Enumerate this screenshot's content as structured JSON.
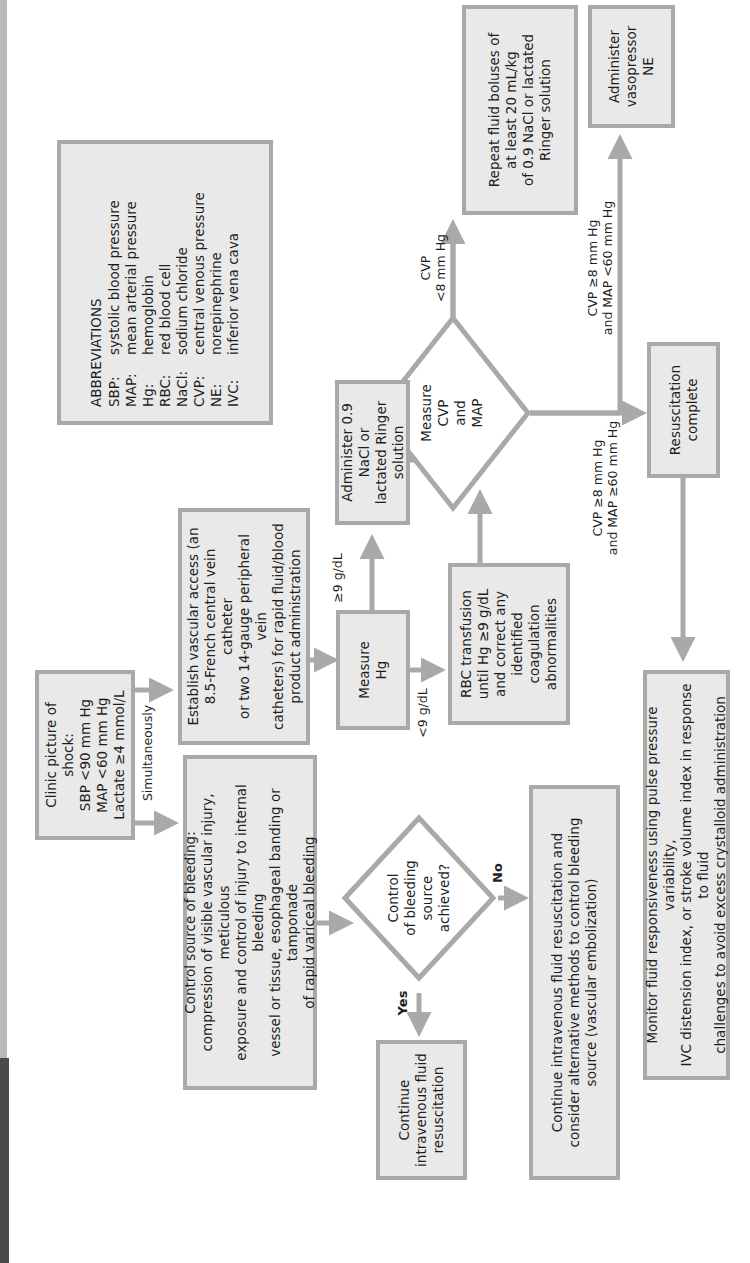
{
  "page": {
    "orientation": "rotated-90-ccw"
  },
  "flowchart": {
    "start": {
      "title": "Clinic picture of shock:",
      "lines": [
        "SBP <90 mm Hg",
        "MAP <60 mm Hg",
        "Lactate ≥4 mmol/L"
      ]
    },
    "branch_label": "Simultaneously",
    "control_bleeding": {
      "title": "Control source of bleeding:",
      "body": "compression of visible vascular injury, meticulous\nexposure and control of injury to internal bleeding\nvessel or tissue, esophageal banding or tamponade\nof rapid variceal bleeding"
    },
    "vascular_access": {
      "text": "Establish vascular access (an\n8.5-French central vein catheter\nor two 14-gauge peripheral vein\ncatheters) for rapid fluid/blood\nproduct administration"
    },
    "bleeding_decision": {
      "text": "Control\nof bleeding\nsource\nachieved?",
      "yes_label": "Yes",
      "no_label": "No"
    },
    "continue_iv": {
      "text": "Continue\nintravenous fluid\nresuscitation"
    },
    "continue_iv_alt": {
      "text": "Continue intravenous fluid resuscitation and\nconsider alternative methods to control bleeding\nsource (vascular embolization)"
    },
    "measure_hg": {
      "text": "Measure\nHg",
      "high_label": "≥9 g/dL",
      "low_label": "<9 g/dL"
    },
    "administer_nacl": {
      "text": "Administer 0.9 NaCl or\nlactated Ringer solution"
    },
    "rbc_transfusion": {
      "text": "RBC transfusion\nuntil Hg ≥9 g/dL\nand correct any\nidentified coagulation\nabnormalities"
    },
    "measure_cvp_map": {
      "text": "Measure\nCVP\nand\nMAP",
      "low_cvp_label": "CVP\n<8 mm Hg",
      "low_map_label": "CVP ≥8 mm Hg\nand MAP <60 mm Hg",
      "ok_label": "CVP ≥8 mm Hg\nand MAP ≥60 mm Hg"
    },
    "repeat_fluid": {
      "text": "Repeat fluid boluses of\nat least 20 mL/kg\nof 0.9 NaCl or lactated\nRinger solution"
    },
    "administer_ne": {
      "text": "Administer\nvasopressor\nNE"
    },
    "resuscitation_complete": {
      "text": "Resuscitation\ncomplete"
    },
    "monitor": {
      "text": "Monitor fluid responsiveness using pulse pressure variability,\nIVC distension index, or stroke volume index in response to fluid\nchallenges to avoid excess crystalloid administration"
    }
  },
  "abbreviations": {
    "title": "ABBREVIATIONS",
    "items": [
      {
        "key": "SBP:",
        "value": "systolic blood pressure"
      },
      {
        "key": "MAP:",
        "value": "mean arterial pressure"
      },
      {
        "key": "Hg:",
        "value": "hemoglobin"
      },
      {
        "key": "RBC:",
        "value": "red blood cell"
      },
      {
        "key": "NaCl:",
        "value": "sodium chloride"
      },
      {
        "key": "CVP:",
        "value": "central venous pressure"
      },
      {
        "key": "NE:",
        "value": "norepinephrine"
      },
      {
        "key": "IVC:",
        "value": "inferior vena cava"
      }
    ]
  },
  "colors": {
    "box_fill": "#e9e9e9",
    "box_border": "#a9a9a9",
    "arrow": "#a9a9a9",
    "text": "#1e1e1e"
  }
}
